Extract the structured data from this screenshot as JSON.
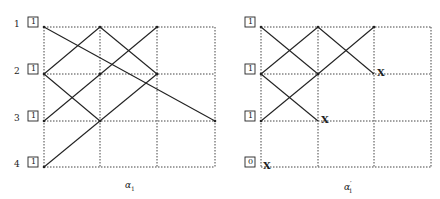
{
  "diagrams": [
    {
      "id": "left",
      "caption": "α",
      "caption_sub": "1",
      "caption_prime": "",
      "row_labels": [
        "1",
        "2",
        "3",
        "4"
      ],
      "box_values": [
        "1",
        "1",
        "1",
        "1"
      ],
      "grid": {
        "cols": 3,
        "rows": 3
      },
      "x_marks": []
    },
    {
      "id": "right",
      "caption": "α",
      "caption_sub": "1",
      "caption_prime": "′",
      "row_labels": [],
      "box_values": [
        "1",
        "1",
        "1",
        "0"
      ],
      "grid": {
        "cols": 3,
        "rows": 3
      },
      "x_marks": [
        "X",
        "X",
        "X"
      ]
    }
  ],
  "colors": {
    "line": "#222222",
    "grid": "#444444",
    "background": "#ffffff"
  }
}
